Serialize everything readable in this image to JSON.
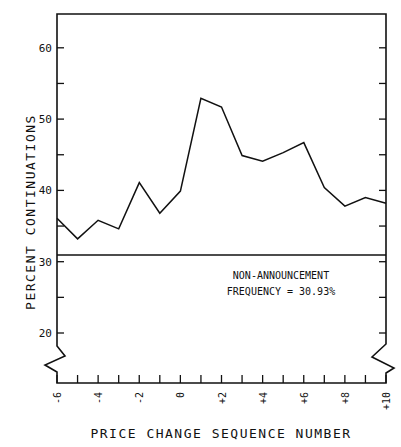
{
  "chart_data": {
    "type": "line",
    "title": "",
    "xlabel": "PRICE CHANGE SEQUENCE NUMBER",
    "ylabel": "PERCENT CONTINUATIONS",
    "x": [
      -6,
      -5,
      -4,
      -3,
      -2,
      -1,
      0,
      1,
      2,
      3,
      4,
      5,
      6,
      7,
      8,
      9,
      10
    ],
    "x_tick_labels": [
      "-6",
      "-4",
      "-2",
      "0",
      "+2",
      "+4",
      "+6",
      "+8",
      "+10"
    ],
    "x_tick_values": [
      -6,
      -4,
      -2,
      0,
      2,
      4,
      6,
      8,
      10
    ],
    "y_tick_labels": [
      "20",
      "30",
      "40",
      "50",
      "60"
    ],
    "y_tick_values": [
      20,
      30,
      40,
      50,
      60
    ],
    "series": [
      {
        "name": "Percent continuations",
        "values": [
          36.1,
          33.2,
          35.8,
          34.6,
          41.1,
          36.8,
          39.9,
          52.9,
          51.7,
          44.9,
          44.1,
          45.3,
          46.7,
          40.4,
          37.8,
          39.0,
          38.2
        ]
      }
    ],
    "reference_line": {
      "value": 30.93,
      "label_line1": "NON-ANNOUNCEMENT",
      "label_line2": "FREQUENCY = 30.93%"
    },
    "ylim": [
      15,
      65
    ],
    "xlim": [
      -6,
      10
    ],
    "grid": false,
    "legend": "none",
    "axis_break": "y-axis broken below 20"
  }
}
